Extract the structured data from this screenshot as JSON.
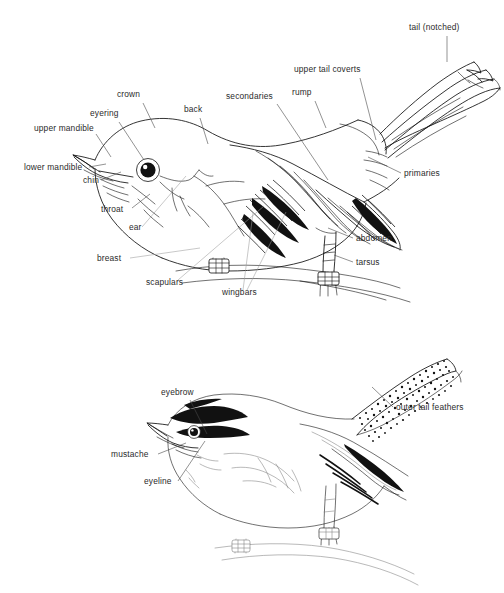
{
  "figure": {
    "type": "line-drawing-diagram",
    "background_color": "#ffffff",
    "ink_color": "#111111",
    "label_color": "#2b2b2b",
    "leader_color": "#4a4a4a",
    "width": 504,
    "height": 593
  },
  "upper_bird": {
    "caption": "Perched songbird, left profile, wing and notched tail detailed",
    "labels": [
      {
        "id": "tail-notched",
        "text": "tail (notched)",
        "x": 409,
        "y": 30,
        "anchor": "start"
      },
      {
        "id": "upper-tail-coverts",
        "text": "upper tail coverts",
        "x": 294,
        "y": 72,
        "anchor": "start"
      },
      {
        "id": "rump",
        "text": "rump",
        "x": 292,
        "y": 95,
        "anchor": "start"
      },
      {
        "id": "secondaries",
        "text": "secondaries",
        "x": 226,
        "y": 99,
        "anchor": "start"
      },
      {
        "id": "crown",
        "text": "crown",
        "x": 117,
        "y": 97,
        "anchor": "start"
      },
      {
        "id": "back",
        "text": "back",
        "x": 184,
        "y": 112,
        "anchor": "start"
      },
      {
        "id": "eyering",
        "text": "eyering",
        "x": 90,
        "y": 116,
        "anchor": "start"
      },
      {
        "id": "upper-mandible",
        "text": "upper mandible",
        "x": 34,
        "y": 131,
        "anchor": "start"
      },
      {
        "id": "lower-mandible",
        "text": "lower mandible",
        "x": 24,
        "y": 170,
        "anchor": "start"
      },
      {
        "id": "chin",
        "text": "chin",
        "x": 83,
        "y": 183,
        "anchor": "start"
      },
      {
        "id": "primaries",
        "text": "primaries",
        "x": 404,
        "y": 176,
        "anchor": "start"
      },
      {
        "id": "throat",
        "text": "throat",
        "x": 101,
        "y": 212,
        "anchor": "start"
      },
      {
        "id": "ear",
        "text": "ear",
        "x": 129,
        "y": 230,
        "anchor": "start"
      },
      {
        "id": "abdomen",
        "text": "abdomen",
        "x": 356,
        "y": 241,
        "anchor": "start"
      },
      {
        "id": "breast",
        "text": "breast",
        "x": 97,
        "y": 261,
        "anchor": "start"
      },
      {
        "id": "tarsus",
        "text": "tarsus",
        "x": 356,
        "y": 265,
        "anchor": "start"
      },
      {
        "id": "scapulars",
        "text": "scapulars",
        "x": 146,
        "y": 285,
        "anchor": "start"
      },
      {
        "id": "wingbars",
        "text": "wingbars",
        "x": 222,
        "y": 295,
        "anchor": "start"
      }
    ]
  },
  "lower_bird": {
    "caption": "Head-pattern songbird, left profile, stippled outer tail feathers",
    "labels": [
      {
        "id": "eyebrow",
        "text": "eyebrow",
        "x": 161,
        "y": 395,
        "anchor": "start"
      },
      {
        "id": "outer-tail-feathers",
        "text": "outer tail feathers",
        "x": 396,
        "y": 410,
        "anchor": "start"
      },
      {
        "id": "mustache",
        "text": "mustache",
        "x": 111,
        "y": 457,
        "anchor": "start"
      },
      {
        "id": "eyeline",
        "text": "eyeline",
        "x": 144,
        "y": 484,
        "anchor": "start"
      }
    ]
  }
}
